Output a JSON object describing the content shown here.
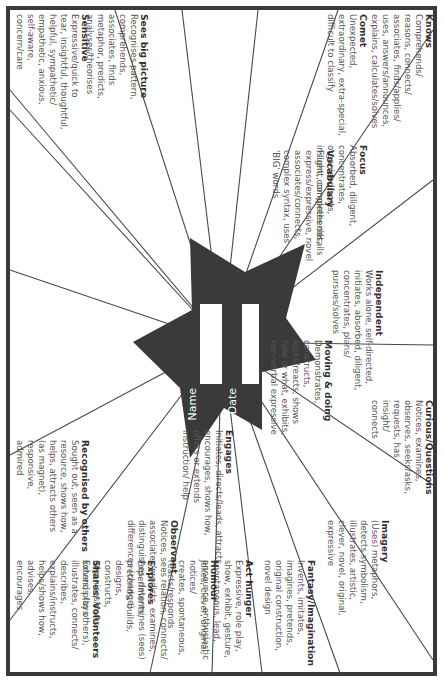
{
  "worksheet": {
    "center": {
      "name_label": "Name",
      "date_label": "Date",
      "star_color": "#3a3a3a"
    },
    "frame_color": "#3a3a3a",
    "sections": [
      {
        "heading": "Knows",
        "body": "Comprehends/\nreasons, connects/\nassociates, finds/applies/\nuses, answers/announces,\nexplains, calculates/solves"
      },
      {
        "heading": "Comet",
        "body": "Unexpected,\nextraordinary, extra-special,\ndifficult to classify"
      },
      {
        "heading": "Focus",
        "body": "Absorbed, diligent,\nconcentrates, organised/sorts,\ninsight, completes details"
      },
      {
        "heading": "Independent",
        "body": "Works alone, self-directed,\ninitiates, absorbed, diligent,\nconcentrates, plans/\npursues/solves"
      },
      {
        "heading": "Curious/Questions",
        "body": "Notices, examines,\nobserves, seeks/asks,\nrequests, has\ninsight/\nconnects"
      },
      {
        "heading": "Vocabulary",
        "body": "Fluent, comprehends,\nexpress/expressive, novel\nassociates/connects,\ncomplex syntax, uses\n'BIG' words"
      },
      {
        "heading": "Imagery",
        "body": "(Uses) metaphors,\ndetects symbolism,\nillustrates, artistic,\nclever, novel, original,\nexpressive"
      },
      {
        "heading": "Moving & doing",
        "body": "Demonstrates,\nconstructs,\nlooks/reacts, shows\nhow or what, exhibits,\nnon-verbal expressive"
      },
      {
        "heading": "Fantasy/Imagination",
        "body": "Invents, imitates,\nimagines, pretends,\noriginal construction,\nnovel design"
      },
      {
        "heading": "Engages",
        "body": "Initiates, directs/leads, attracts,\nencourages, shows how,\noffers or extends\ninstruction/ help"
      },
      {
        "heading": "Act hunger",
        "body": "Expressive, role play,\nshow, exhibit, gesture,\nspontaneous, lead,\nannounce, enthusiastic"
      },
      {
        "heading": "Recognised by others",
        "body": "Sought out, seen as a\nresource, shows how,\nhelps, attracts others\n(as magnet),\nresponsive,\nadmired"
      },
      {
        "heading": "Shares/\nVolunteers",
        "body": "Extends (to others),\nillustrates, connects/\ndescribes, explains/instructs,\nhelps/shows how, advises,\nencourages"
      },
      {
        "heading": "Explores",
        "body": "Experiments,\npretends, builds, designs,\nconstructs, organises/sorts,\nsolves, plays"
      },
      {
        "heading": "Observant",
        "body": "Notices, sees relation, connects/\nassociates/predicts, examines,\ndistinguishes, determines (sees)\ndifferences (change)"
      },
      {
        "heading": "Humour",
        "body": "Jokes, clever, original, notices/\ncreates, spontaneous,\nreacts/responds"
      },
      {
        "heading": "Sensitive",
        "body": "Expressive/quick to\ntear, insightful, thoughtful,\nhelpful, sympathetic/\nempathetic, anxious,\nself-aware,\nconcern/care"
      },
      {
        "heading": "Sees\nbig picture",
        "body": "Recognises pattern,\ncomprehends,\nassociates, finds\nmetaphor, predicts,\nanalyses/theorises"
      }
    ]
  }
}
